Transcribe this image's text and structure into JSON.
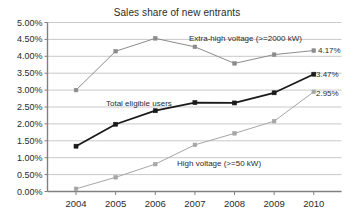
{
  "chart_data": {
    "type": "line",
    "title": "Sales share of new entrants",
    "xlabel": "",
    "ylabel": "",
    "categories": [
      "2004",
      "2005",
      "2006",
      "2007",
      "2008",
      "2009",
      "2010"
    ],
    "ylim": [
      0,
      5
    ],
    "ytick_labels": [
      "0.00%",
      "0.50%",
      "1.00%",
      "1.50%",
      "2.00%",
      "2.50%",
      "3.00%",
      "3.50%",
      "4.00%",
      "4.50%",
      "5.00%"
    ],
    "ytick_values": [
      0,
      0.5,
      1.0,
      1.5,
      2.0,
      2.5,
      3.0,
      3.5,
      4.0,
      4.5,
      5.0
    ],
    "grid": true,
    "legend_position": "inline-annotations",
    "series": [
      {
        "name": "Extra-high voltage (>=2000 kW)",
        "color": "#8c8c8c",
        "width": 1,
        "marker": "square",
        "values": [
          3.0,
          4.15,
          4.53,
          4.28,
          3.79,
          4.05,
          4.17
        ],
        "end_label": "4.17%"
      },
      {
        "name": "Total eligible users",
        "color": "#1a1a1a",
        "width": 1.8,
        "marker": "square",
        "values": [
          1.34,
          1.99,
          2.39,
          2.63,
          2.62,
          2.92,
          3.47
        ],
        "end_label": "3.47%"
      },
      {
        "name": "High voltage (>=50 kW)",
        "color": "#a6a6a6",
        "width": 1,
        "marker": "square",
        "values": [
          0.08,
          0.42,
          0.81,
          1.38,
          1.72,
          2.08,
          2.95
        ],
        "end_label": "2.95%"
      }
    ],
    "annotations": [
      {
        "text": "Extra-high voltage (>=2000 kW)",
        "x_px": 189,
        "y_px": 34
      },
      {
        "text": "Total eligible users",
        "x_px": 106,
        "y_px": 99
      },
      {
        "text": "High voltage (>=50 kW)",
        "x_px": 177,
        "y_px": 159
      },
      {
        "text": "4.17%",
        "x_px": 318,
        "y_px": 46
      },
      {
        "text": "3.47%",
        "x_px": 316,
        "y_px": 70
      },
      {
        "text": "2.95%",
        "x_px": 316,
        "y_px": 89
      }
    ]
  },
  "axis_colors": {
    "grid": "#c9c9c9",
    "axis": "#808080",
    "text": "#2b2b2b"
  }
}
